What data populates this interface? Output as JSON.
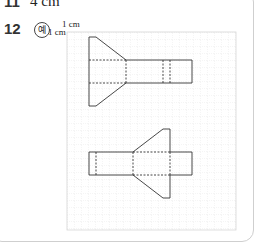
{
  "q11": {
    "number": "11",
    "answer": "4 cm"
  },
  "q12": {
    "number": "12",
    "example_mark": "예"
  },
  "grid": {
    "unit_label_x": "1 cm",
    "unit_label_y": "1 cm",
    "cell_px": 7,
    "cols": 24,
    "rows": 28
  }
}
